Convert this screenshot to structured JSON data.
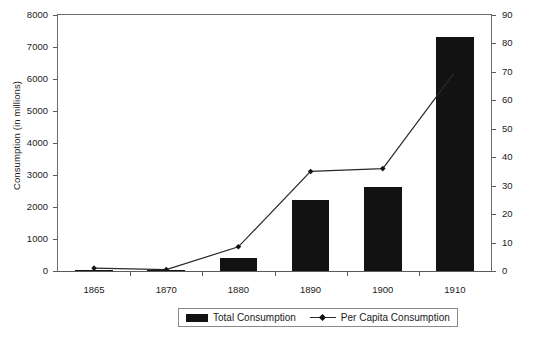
{
  "chart_data": {
    "type": "bar",
    "title": "",
    "subtitle": "",
    "xlabel": "",
    "ylabel": "Consumption (in millions)",
    "y2label": "Per Capita Consumption",
    "categories": [
      "1865",
      "1870",
      "1880",
      "1890",
      "1900",
      "1910"
    ],
    "ylim": [
      0,
      8000
    ],
    "y2lim": [
      0,
      90
    ],
    "yticks": [
      "0",
      "1000",
      "2000",
      "3000",
      "4000",
      "5000",
      "6000",
      "7000",
      "8000"
    ],
    "ytick_values": [
      0,
      1000,
      2000,
      3000,
      4000,
      5000,
      6000,
      7000,
      8000
    ],
    "y2ticks": [
      "0",
      "10",
      "20",
      "30",
      "40",
      "50",
      "60",
      "70",
      "80",
      "90"
    ],
    "y2tick_values": [
      0,
      10,
      20,
      30,
      40,
      50,
      60,
      70,
      80,
      90
    ],
    "grid": false,
    "legend_position": "bottom",
    "series": [
      {
        "name": "Total Consumption",
        "type": "bar",
        "axis": "left",
        "color": "#121212",
        "values": [
          20,
          20,
          400,
          2230,
          2640,
          7320
        ]
      },
      {
        "name": "Per Capita Consumption",
        "type": "line",
        "axis": "right",
        "color": "#2a2a2a",
        "marker": "diamond",
        "values": [
          1,
          0.5,
          8.5,
          35,
          36,
          70
        ]
      }
    ]
  },
  "legend": {
    "items": [
      {
        "label": "Total Consumption",
        "swatch": "bar-swatch"
      },
      {
        "label": "Per Capita Consumption",
        "swatch": "line-marker-swatch"
      }
    ]
  },
  "colors": {
    "bar": "#121212",
    "line": "#2a2a2a",
    "axis": "#5a5a5a",
    "text": "#1a1a1a",
    "background": "#ffffff"
  }
}
